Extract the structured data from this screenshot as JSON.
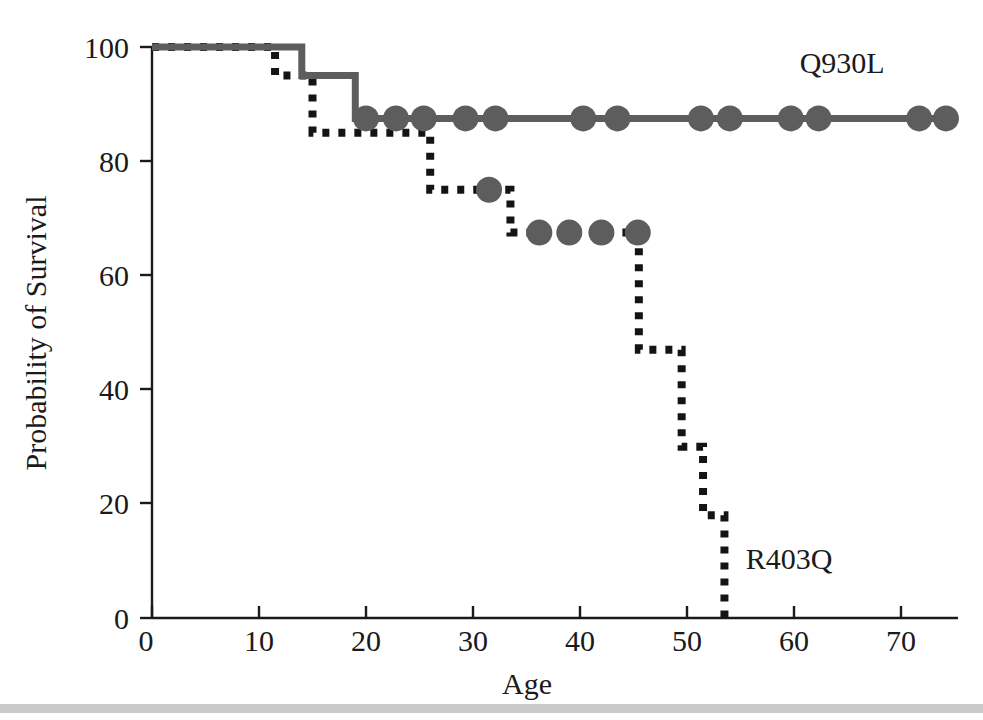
{
  "chart_data": {
    "type": "line",
    "title": "",
    "subtitle": "",
    "xlabel": "Age",
    "ylabel": "Probability of Survival",
    "xlim": [
      0,
      75
    ],
    "ylim": [
      0,
      100
    ],
    "xticks": [
      0,
      10,
      20,
      30,
      40,
      50,
      60,
      70
    ],
    "xtick_labels": [
      "0",
      "10",
      "20",
      "30",
      "40",
      "50",
      "60",
      "70"
    ],
    "yticks": [
      0,
      20,
      40,
      60,
      80,
      100
    ],
    "ytick_labels": [
      "0",
      "20",
      "40",
      "60",
      "80",
      "100"
    ],
    "grid": false,
    "legend_position": "inline-annotation",
    "series": [
      {
        "name": "Q930L",
        "label": "Q930L",
        "style": "solid",
        "color": "#5d5d5d",
        "label_x": 64.5,
        "label_y": 95.5,
        "steps_x": [
          0,
          14,
          14,
          19,
          19,
          74
        ],
        "steps_y": [
          100,
          100,
          95,
          95,
          87.5,
          87.5
        ],
        "censor_points": [
          {
            "x": 20.0,
            "y": 87.5
          },
          {
            "x": 22.8,
            "y": 87.5
          },
          {
            "x": 25.4,
            "y": 87.5
          },
          {
            "x": 29.3,
            "y": 87.5
          },
          {
            "x": 32.1,
            "y": 87.5
          },
          {
            "x": 40.3,
            "y": 87.5
          },
          {
            "x": 43.5,
            "y": 87.5
          },
          {
            "x": 51.3,
            "y": 87.5
          },
          {
            "x": 54.0,
            "y": 87.5
          },
          {
            "x": 59.7,
            "y": 87.5
          },
          {
            "x": 62.3,
            "y": 87.5
          },
          {
            "x": 71.7,
            "y": 87.5
          },
          {
            "x": 74.2,
            "y": 87.5
          }
        ]
      },
      {
        "name": "R403Q",
        "label": "R403Q",
        "style": "dotted",
        "color": "#141414",
        "label_x": 55.5,
        "label_y": 8.5,
        "steps_x": [
          0,
          11.5,
          11.5,
          15.0,
          15.0,
          26.0,
          26.0,
          33.5,
          33.5,
          45.5,
          45.5,
          49.5,
          49.5,
          51.5,
          51.5,
          53.5,
          53.5
        ],
        "steps_y": [
          100,
          100,
          95,
          95,
          85,
          85,
          75,
          75,
          67.5,
          67.5,
          47,
          47,
          30,
          30,
          18,
          18,
          0
        ],
        "censor_points": [
          {
            "x": 31.5,
            "y": 75.0
          },
          {
            "x": 36.2,
            "y": 67.5
          },
          {
            "x": 39.0,
            "y": 67.5
          },
          {
            "x": 42.0,
            "y": 67.5
          },
          {
            "x": 45.4,
            "y": 67.5
          }
        ]
      }
    ]
  },
  "figure": {
    "background": "#ffffff",
    "axis_color": "#1a1a1a"
  }
}
